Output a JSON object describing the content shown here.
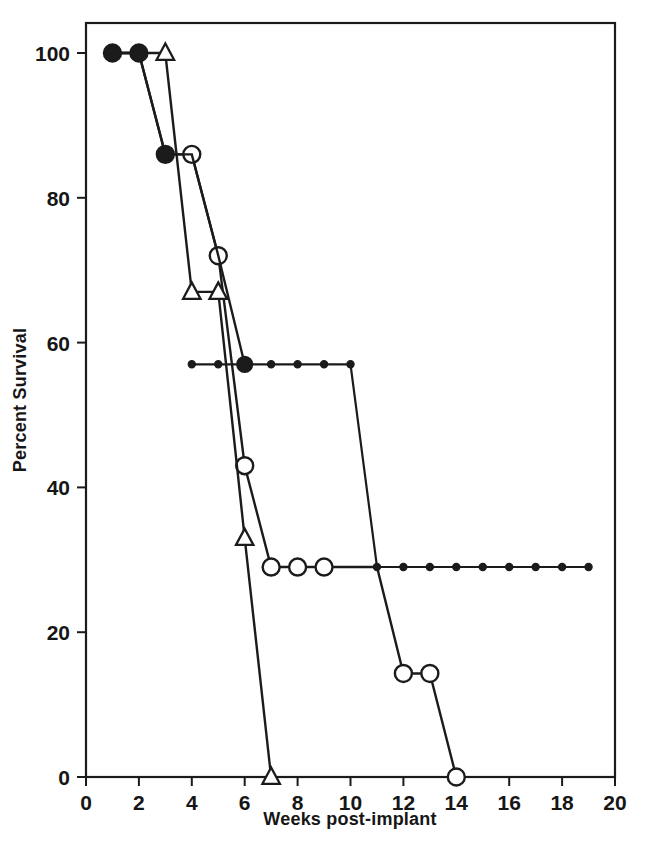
{
  "chart_data": {
    "type": "line",
    "title": "",
    "subtitle": "",
    "xlabel": "Weeks post-implant",
    "ylabel": "Percent Survival",
    "xlim": [
      0,
      20
    ],
    "ylim": [
      0,
      100
    ],
    "xticks": [
      0,
      2,
      4,
      6,
      8,
      10,
      12,
      14,
      16,
      18,
      20
    ],
    "xticklabels": [
      "0",
      "2",
      "4",
      "6",
      "8",
      "10",
      "12",
      "14",
      "16",
      "18",
      "20"
    ],
    "yticks": [
      0,
      20,
      40,
      60,
      80,
      100
    ],
    "yticklabels": [
      "0",
      "20",
      "40",
      "60",
      "80",
      "100"
    ],
    "grid": false,
    "legend": "none",
    "frame": "box",
    "series": [
      {
        "name": "open-circle-series",
        "marker": "open-circle",
        "x": [
          1,
          2,
          3,
          4,
          5,
          6,
          7,
          8,
          9,
          10,
          11,
          12,
          13,
          14
        ],
        "y": [
          100,
          100,
          86,
          86,
          72,
          43,
          29,
          29,
          29,
          29,
          29,
          14.3,
          14.3,
          0
        ],
        "marker_x": [
          1,
          2,
          3,
          4,
          5,
          6,
          7,
          8,
          9,
          12,
          13,
          14
        ],
        "marker_y": [
          100,
          100,
          86,
          86,
          72,
          43,
          29,
          29,
          29,
          14.3,
          14.3,
          0
        ]
      },
      {
        "name": "triangle-series",
        "marker": "open-triangle",
        "x": [
          1,
          2,
          3,
          4,
          5,
          6,
          7
        ],
        "y": [
          100,
          100,
          100,
          67,
          67,
          33,
          0
        ],
        "marker_x": [
          3,
          4,
          5,
          6,
          7
        ],
        "marker_y": [
          100,
          67,
          67,
          33,
          0
        ]
      },
      {
        "name": "small-dot-series",
        "marker": "small-filled-dot",
        "x": [
          4,
          5,
          6,
          7,
          8,
          9,
          10,
          11,
          12,
          13,
          14,
          15,
          16,
          17,
          18,
          19
        ],
        "y": [
          57,
          57,
          57,
          57,
          57,
          57,
          57,
          29,
          29,
          29,
          29,
          29,
          29,
          29,
          29,
          29
        ],
        "marker_x": [
          4,
          5,
          6,
          7,
          8,
          9,
          10,
          11,
          12,
          13,
          14,
          15,
          16,
          17,
          18,
          19
        ],
        "marker_y": [
          57,
          57,
          57,
          57,
          57,
          57,
          57,
          29,
          29,
          29,
          29,
          29,
          29,
          29,
          29,
          29
        ]
      },
      {
        "name": "filled-circle-series",
        "marker": "filled-circle",
        "x": [
          1,
          2,
          3,
          4,
          5,
          6
        ],
        "y": [
          100,
          100,
          86,
          86,
          72,
          57
        ],
        "marker_x": [
          1,
          2,
          3,
          6
        ],
        "marker_y": [
          100,
          100,
          86,
          57
        ]
      }
    ],
    "annotations": []
  },
  "colors": {
    "ink": "#1b1b1b",
    "background": "#ffffff"
  }
}
